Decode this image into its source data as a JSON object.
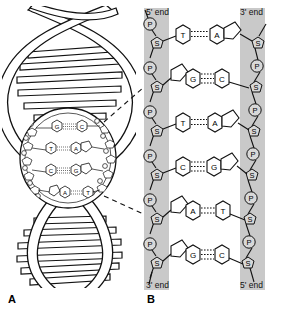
{
  "figure": {
    "panels": [
      {
        "letter": "A",
        "name": "dna-double-helix",
        "description": "Double helix with magnified circular inset",
        "inset_base_pairs": [
          {
            "left": "G",
            "right": "C",
            "bonds": 3
          },
          {
            "left": "T",
            "right": "A",
            "bonds": 2
          },
          {
            "left": "C",
            "right": "G",
            "bonds": 3
          },
          {
            "left": "A",
            "right": "T",
            "bonds": 2
          }
        ]
      },
      {
        "letter": "B",
        "name": "dna-ladder-diagram",
        "description": "Unwound ladder showing sugar-phosphate backbone and base pairs",
        "labels": {
          "top_left": "5' end",
          "top_right": "3' end",
          "bottom_left": "3' end",
          "bottom_right": "5' end"
        },
        "base_pairs": [
          {
            "left": "T",
            "right": "A",
            "bonds": 2,
            "left_type": "pyrimidine",
            "right_type": "purine"
          },
          {
            "left": "G",
            "right": "C",
            "bonds": 3,
            "left_type": "purine",
            "right_type": "pyrimidine"
          },
          {
            "left": "T",
            "right": "A",
            "bonds": 2,
            "left_type": "pyrimidine",
            "right_type": "purine"
          },
          {
            "left": "C",
            "right": "G",
            "bonds": 3,
            "left_type": "pyrimidine",
            "right_type": "purine"
          },
          {
            "left": "A",
            "right": "T",
            "bonds": 2,
            "left_type": "purine",
            "right_type": "pyrimidine"
          },
          {
            "left": "G",
            "right": "C",
            "bonds": 3,
            "left_type": "purine",
            "right_type": "pyrimidine"
          }
        ],
        "backbone_units": {
          "phosphate": "P",
          "sugar": "S"
        },
        "left_backbone_sequence": [
          "P",
          "S",
          "P",
          "S",
          "P",
          "S",
          "P",
          "S",
          "P",
          "S",
          "P",
          "S"
        ],
        "right_backbone_sequence": [
          "S",
          "P",
          "S",
          "P",
          "S",
          "P",
          "S",
          "P",
          "S",
          "P",
          "S"
        ]
      }
    ],
    "colors": {
      "band_gray": "#c9c9c9",
      "stroke": "#111111",
      "unit_fill": "#d8d8d8",
      "base_fill": "#ffffff",
      "background": "#ffffff"
    }
  }
}
